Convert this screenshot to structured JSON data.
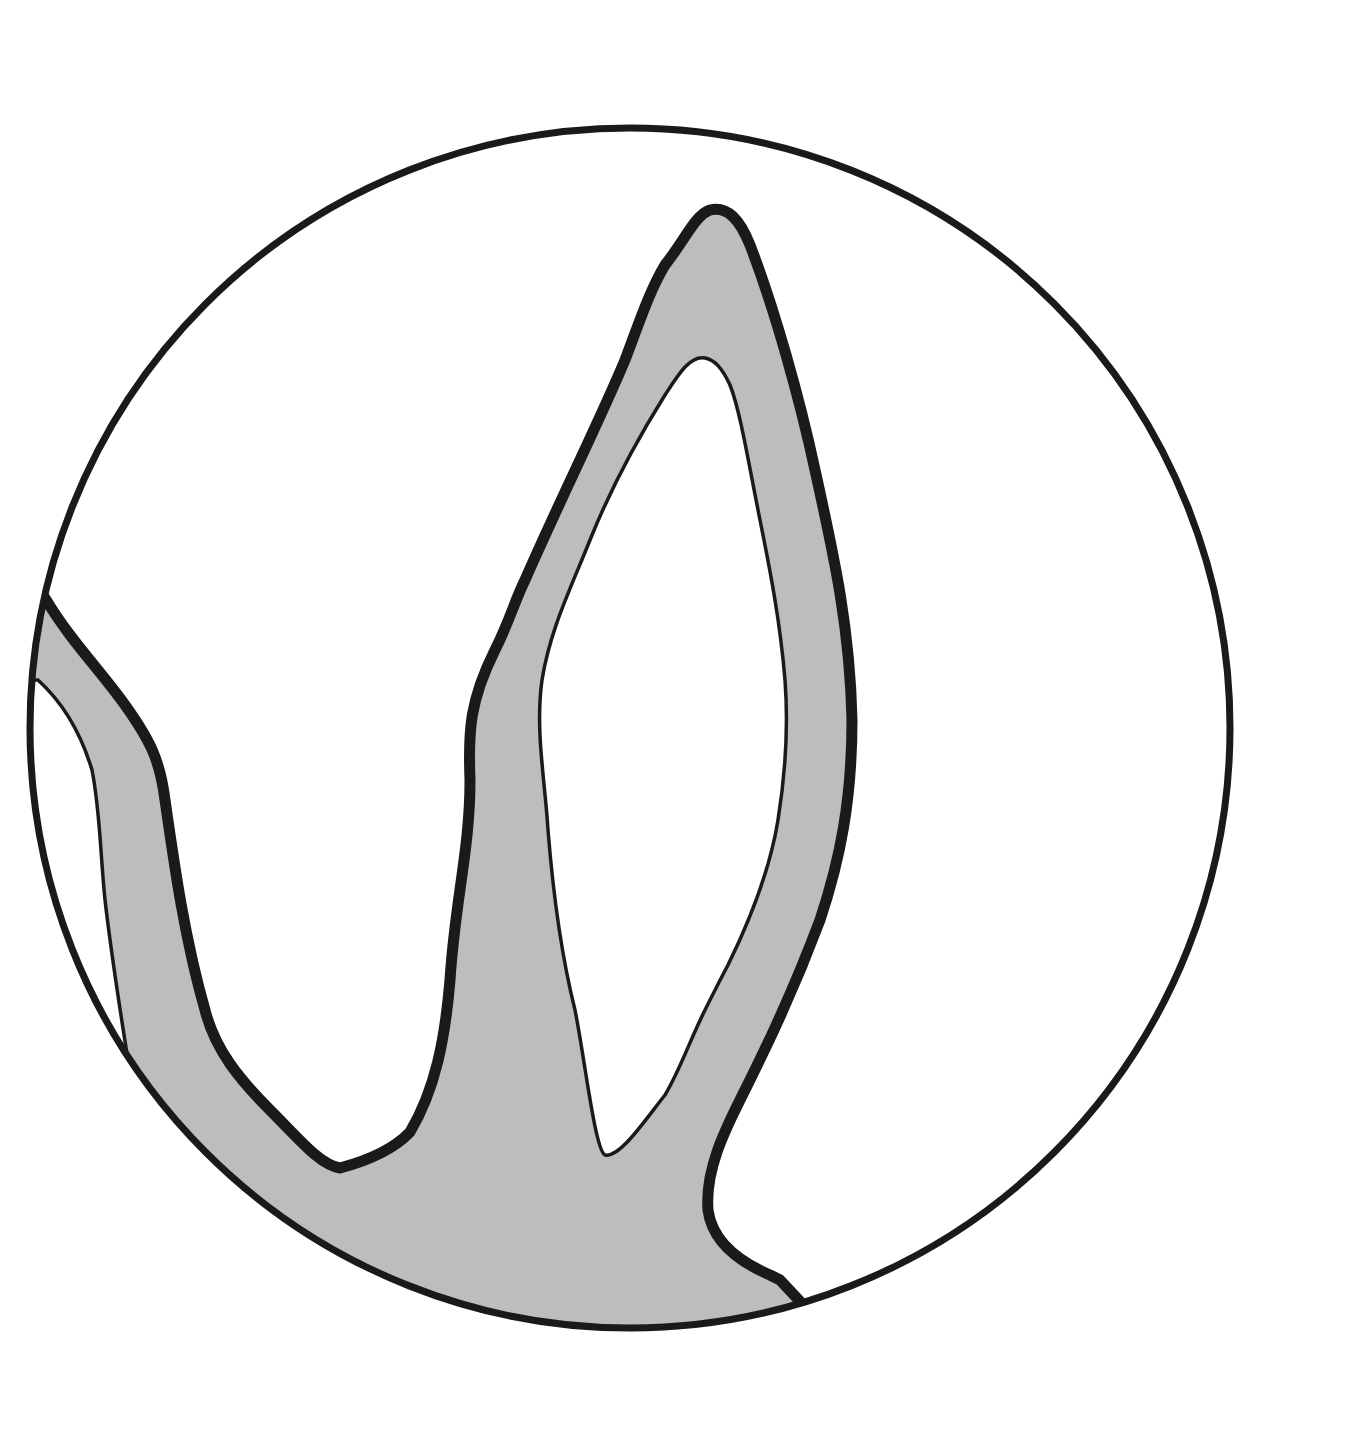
{
  "figure": {
    "colors": {
      "background": "#ffffff",
      "outline": "#1a1a1a",
      "fill": "#bdbdbd",
      "lumen": "#ffffff"
    },
    "circle": {
      "cx": 630,
      "cy": 728,
      "r": 602
    }
  }
}
